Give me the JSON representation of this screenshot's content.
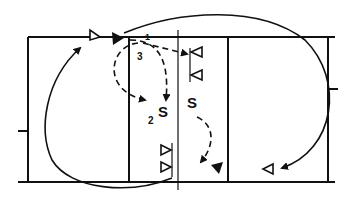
{
  "diagram": {
    "type": "volleyball-court-play",
    "colors": {
      "line": "#111111",
      "background": "#ffffff"
    },
    "labels": {
      "pass1": "1",
      "pass2": "2",
      "pass3": "3",
      "setter_left": "S",
      "setter_right": "S"
    },
    "players": {
      "top_left_server": "triangle",
      "block_top": [
        "triangle",
        "triangle"
      ],
      "block_bottom": [
        "triangle",
        "triangle"
      ],
      "back_right": "triangle"
    }
  }
}
